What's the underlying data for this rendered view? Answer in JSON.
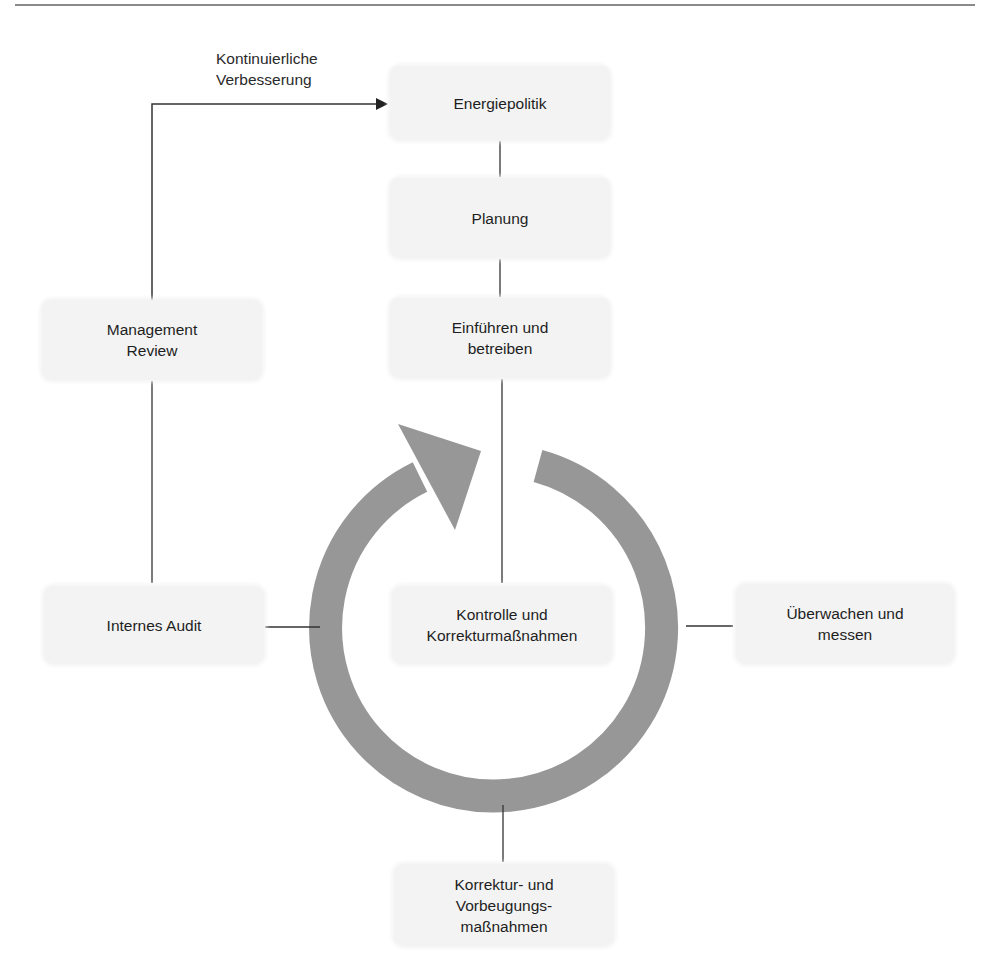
{
  "diagram": {
    "annotation": {
      "line1": "Kontinuierliche",
      "line2": "Verbesserung"
    },
    "nodes": {
      "energiepolitik": "Energiepolitik",
      "planung": "Planung",
      "einfuehren": {
        "line1": "Einführen und",
        "line2": "betreiben"
      },
      "management_review": {
        "line1": "Management",
        "line2": "Review"
      },
      "internes_audit": "Internes Audit",
      "kontrolle": {
        "line1": "Kontrolle und",
        "line2": "Korrekturmaßnahmen"
      },
      "ueberwachen": {
        "line1": "Überwachen und",
        "line2": "messen"
      },
      "korrektur": {
        "line1": "Korrektur- und",
        "line2": "Vorbeugungs-",
        "line3": "maßnahmen"
      }
    },
    "colors": {
      "box_fill": "#f3f3f3",
      "cycle_arrow": "#979797",
      "connector": "#333333",
      "rule": "#8a8a8a"
    }
  },
  "footer": {
    "cut_text": ""
  }
}
